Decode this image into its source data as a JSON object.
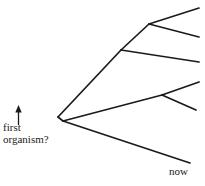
{
  "diagram": {
    "stroke_color": "#1a1a1a",
    "background_color": "#ffffff",
    "labels": {
      "root_line1": "first",
      "root_line2": "organism?",
      "present_day": "now"
    },
    "arrow": {
      "name": "root-pointer-arrow",
      "from": [
        18,
        124
      ],
      "to": [
        18,
        106
      ]
    },
    "nodes": [
      {
        "id": "root",
        "x": 58,
        "y": 117,
        "label": "first organism?"
      },
      {
        "id": "upper-split",
        "x": 121,
        "y": 50
      },
      {
        "id": "upper-upper-split",
        "x": 149,
        "y": 24
      },
      {
        "id": "lower-split",
        "x": 63,
        "y": 121
      },
      {
        "id": "lower-upper-split",
        "x": 162,
        "y": 95
      }
    ],
    "branches": [
      {
        "name": "root-to-upper-split",
        "from": [
          58,
          117
        ],
        "to": [
          121,
          50
        ]
      },
      {
        "name": "upper-split-to-upper-upper-split",
        "from": [
          121,
          50
        ],
        "to": [
          149,
          24
        ]
      },
      {
        "name": "upper-upper-split-to-tip-1",
        "from": [
          149,
          24
        ],
        "to": [
          199,
          8
        ]
      },
      {
        "name": "upper-upper-split-to-tip-2",
        "from": [
          149,
          24
        ],
        "to": [
          199,
          37
        ]
      },
      {
        "name": "upper-split-to-tip-3",
        "from": [
          121,
          50
        ],
        "to": [
          199,
          62
        ]
      },
      {
        "name": "root-to-lower-split",
        "from": [
          58,
          117
        ],
        "to": [
          63,
          121
        ]
      },
      {
        "name": "lower-split-to-lower-upper-split",
        "from": [
          63,
          121
        ],
        "to": [
          162,
          95
        ]
      },
      {
        "name": "lower-upper-split-to-tip-4",
        "from": [
          162,
          95
        ],
        "to": [
          199,
          82
        ]
      },
      {
        "name": "lower-upper-split-to-tip-5",
        "from": [
          162,
          95
        ],
        "to": [
          196,
          110
        ]
      },
      {
        "name": "lower-split-to-tip-6",
        "from": [
          63,
          121
        ],
        "to": [
          190,
          163
        ]
      }
    ]
  }
}
